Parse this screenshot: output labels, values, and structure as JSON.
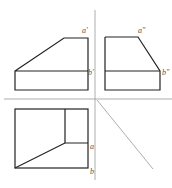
{
  "diagram": {
    "type": "orthographic-projection",
    "views": [
      "front",
      "side",
      "top"
    ],
    "labels": {
      "front_a": "a′",
      "front_b": "b′",
      "side_a": "a″",
      "side_b": "b″",
      "top_a": "a",
      "top_b": "b"
    },
    "colors": {
      "outline": "#222222",
      "axis": "#999999",
      "label": "#555555"
    }
  }
}
